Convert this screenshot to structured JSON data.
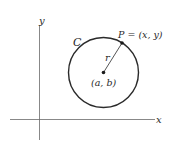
{
  "diagram": {
    "axes": {
      "x_label": "x",
      "y_label": "y",
      "color": "#6a6a6a"
    },
    "circle": {
      "label": "C",
      "center_label": "(a, b)",
      "radius_label": "r",
      "color": "#2a2a2a"
    },
    "point": {
      "label": "P = (x, y)"
    }
  }
}
